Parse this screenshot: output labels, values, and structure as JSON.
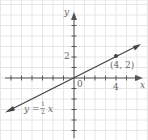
{
  "chart_data": {
    "type": "line",
    "title": "",
    "xlabel": "x",
    "ylabel": "y",
    "xlim": [
      -7,
      6.5
    ],
    "ylim": [
      -6,
      7
    ],
    "grid": true,
    "x_ticks_labeled": [
      {
        "value": 4,
        "label": "4"
      }
    ],
    "y_ticks_labeled": [
      {
        "value": 2,
        "label": "2"
      }
    ],
    "origin_label": "0",
    "series": [
      {
        "name": "y = 1/2 x",
        "equation": "y = ½x",
        "slope": 0.5,
        "intercept": 0,
        "x": [
          -6.8,
          6.2
        ],
        "y": [
          -3.4,
          3.1
        ],
        "arrows_both_ends": true
      }
    ],
    "points": [
      {
        "x": 4,
        "y": 2,
        "label": "(4, 2)"
      }
    ],
    "annotations": [
      {
        "text": "y = ½ x",
        "position": "lower-left near line"
      },
      {
        "text": "(4, 2)",
        "position": "below-left of marked point"
      }
    ]
  },
  "labels": {
    "x_axis": "x",
    "y_axis": "y",
    "origin": "0",
    "tick_x4": "4",
    "tick_y2": "2",
    "point_label": "(4, 2)",
    "eq_prefix": "y = ",
    "eq_num": "1",
    "eq_den": "2",
    "eq_suffix": "x"
  },
  "colors": {
    "grid": "#e6e6e6",
    "axis": "#555555",
    "line": "#444444",
    "text": "#666666"
  }
}
